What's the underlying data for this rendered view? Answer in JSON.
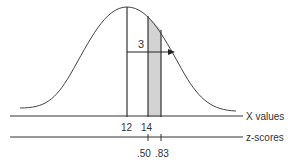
{
  "diagram": {
    "type": "normal-distribution",
    "shaded_region": "between X=14 and z=.83",
    "arrow_label": "3",
    "x_axis_label": "X values",
    "z_axis_label": "z-scores",
    "x_ticks": [
      "12",
      "14"
    ],
    "z_ticks": [
      ".50",
      ".83"
    ],
    "colors": {
      "line": "#333333",
      "shade": "#d3d3d3"
    }
  }
}
